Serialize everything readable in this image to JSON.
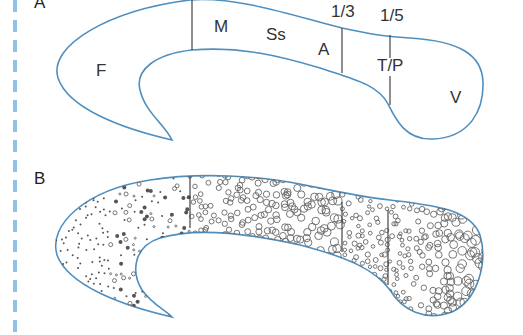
{
  "figure": {
    "panel_a": {
      "label": "A",
      "regions": {
        "frontal": "F",
        "motor": "M",
        "somatosensory": "Ss",
        "association": "A",
        "temporal_parietal": "T/P",
        "visual": "V"
      },
      "markers": {
        "one_third": "1/3",
        "one_fifth": "1/5"
      }
    },
    "panel_b": {
      "label": "B"
    },
    "colors": {
      "outline": "#4f8fbf",
      "divider": "#333333",
      "dashed_rule": "#8ec3e6"
    }
  }
}
